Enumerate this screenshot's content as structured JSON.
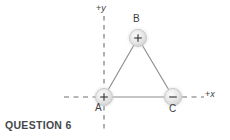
{
  "figure": {
    "axes": {
      "y_label": "+y",
      "x_label": "+x",
      "y_axis_style": "dashed",
      "x_axis_style": "dashed",
      "axis_color": "#6e6e6e",
      "origin": {
        "x": 104,
        "y": 97
      }
    },
    "charges": [
      {
        "id": "A",
        "label": "A",
        "sign": "+",
        "sign_glyph": "+",
        "cx": 104,
        "cy": 97,
        "r": 8.5,
        "fill": "#dedede"
      },
      {
        "id": "B",
        "label": "B",
        "sign": "+",
        "sign_glyph": "+",
        "cx": 138,
        "cy": 38,
        "r": 8.5,
        "fill": "#dedede"
      },
      {
        "id": "C",
        "label": "C",
        "sign": "-",
        "sign_glyph": "−",
        "cx": 173,
        "cy": 97,
        "r": 8.5,
        "fill": "#dedede"
      }
    ],
    "connectors": [
      {
        "from": "A",
        "to": "B"
      },
      {
        "from": "B",
        "to": "C"
      },
      {
        "from": "A",
        "to": "C"
      }
    ],
    "connector_color": "#8a8a8a"
  },
  "caption": {
    "question_label": "QUESTION 6"
  }
}
